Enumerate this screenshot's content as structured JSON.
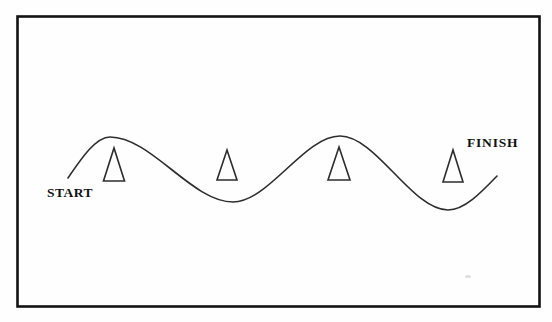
{
  "figure": {
    "start_label": "START",
    "finish_label": "FINISH"
  },
  "diagram": {
    "type": "slalom-course",
    "background": "#fefefe",
    "border_color": "#121212",
    "border_width": 2.6,
    "line_color": "#2d2d2d",
    "line_width": 1.6,
    "boundary": {
      "x": 17.5,
      "y": 16.5,
      "width": 522,
      "height": 290
    },
    "path_points": [
      {
        "x": 68,
        "y": 178,
        "type": "start"
      },
      {
        "x": 110,
        "y": 137,
        "type": "peak"
      },
      {
        "x": 233,
        "y": 202,
        "type": "trough"
      },
      {
        "x": 340,
        "y": 136,
        "type": "peak"
      },
      {
        "x": 448,
        "y": 210,
        "type": "trough"
      },
      {
        "x": 497,
        "y": 176,
        "type": "end"
      }
    ],
    "cones": [
      {
        "cx": 114,
        "apex_y": 148,
        "base_y": 181,
        "half_width": 10.5
      },
      {
        "cx": 227,
        "apex_y": 150,
        "base_y": 180,
        "half_width": 10
      },
      {
        "cx": 339,
        "apex_y": 147,
        "base_y": 180,
        "half_width": 11
      },
      {
        "cx": 453,
        "apex_y": 150,
        "base_y": 182,
        "half_width": 10
      }
    ],
    "speck": {
      "cx": 468,
      "cy": 276.5,
      "rx": 3,
      "ry": 1.5,
      "color": "#c9c9c9"
    }
  }
}
